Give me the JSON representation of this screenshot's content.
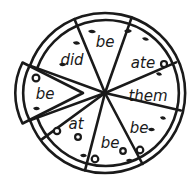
{
  "figure": {
    "background_color": "#ffffff",
    "line_color": "#1a1a1a",
    "text_color": "#1a1a1a",
    "shape": "circle divided into 8 wedge slices, one slice detached to the left"
  },
  "pizza": {
    "slice_count": 8,
    "detached_slice_count": 1,
    "attached_slice_count": 7,
    "center": {
      "x": 105,
      "y": 93
    },
    "radius": 80,
    "crust_thickness": 7,
    "slices": [
      {
        "id": "slice-top",
        "word": "be",
        "position": "top",
        "detached": false,
        "label_x": 105,
        "label_y": 42
      },
      {
        "id": "slice-top-right",
        "word": "ate",
        "position": "top-right",
        "detached": false,
        "label_x": 143,
        "label_y": 63
      },
      {
        "id": "slice-right",
        "word": "them",
        "position": "right",
        "detached": false,
        "label_x": 149,
        "label_y": 96
      },
      {
        "id": "slice-bottom-right",
        "word": "be",
        "position": "bottom-right",
        "detached": false,
        "label_x": 139,
        "label_y": 128
      },
      {
        "id": "slice-bottom",
        "word": "be",
        "position": "bottom",
        "detached": false,
        "label_x": 110,
        "label_y": 143
      },
      {
        "id": "slice-bottom-left",
        "word": "at",
        "position": "bottom-left",
        "detached": false,
        "label_x": 76,
        "label_y": 124
      },
      {
        "id": "slice-top-left",
        "word": "did",
        "position": "top-left",
        "detached": false,
        "label_x": 72,
        "label_y": 60
      },
      {
        "id": "slice-detached",
        "word": "be",
        "position": "left-detached",
        "detached": true,
        "label_x": 44,
        "label_y": 93
      }
    ],
    "toppings": {
      "olive_count": 7,
      "herb_count": 11,
      "olive_label": "olive",
      "herb_label": "herb-flake"
    }
  }
}
